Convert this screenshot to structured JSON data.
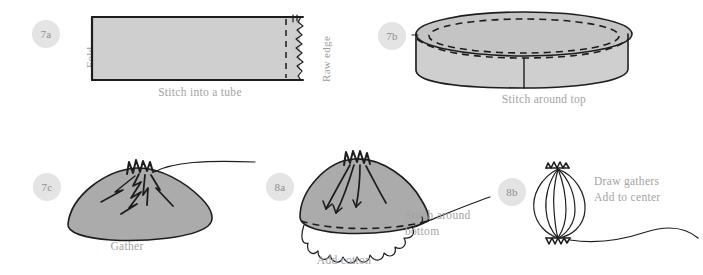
{
  "diagram": {
    "background_color": "#ffffff",
    "fabric_fill": "#cfcfcf",
    "shape_fill": "#ababab",
    "line_color": "#1d1d1d",
    "caption_color": "#a3a3a3",
    "badge_background": "#e4e4e4",
    "badge_text_color": "#8e8e8e"
  },
  "panels": [
    {
      "id": "7a",
      "badge": "7a",
      "caption": "Stitch into a tube",
      "labels": {
        "left": "Fold",
        "right": "Raw edge"
      }
    },
    {
      "id": "7b",
      "badge": "7b",
      "caption": "Stitch around top"
    },
    {
      "id": "7c",
      "badge": "7c",
      "caption": "Gather"
    },
    {
      "id": "8a",
      "badge": "8a",
      "caption": "Add cotton",
      "side_caption_line1": "Stitch around",
      "side_caption_line2": "bottom"
    },
    {
      "id": "8b",
      "badge": "8b",
      "caption_line1": "Draw gathers",
      "caption_line2": "Add to center"
    }
  ]
}
